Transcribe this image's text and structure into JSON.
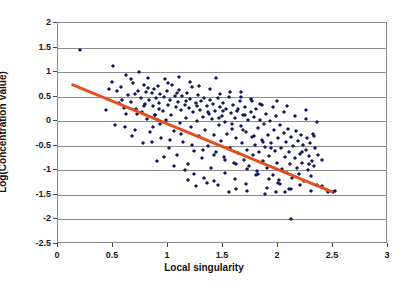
{
  "chart_data": {
    "type": "scatter",
    "title": "",
    "xlabel": "Local singularity",
    "ylabel": "Log(Concentration Value)",
    "xlim": [
      0,
      3
    ],
    "ylim": [
      -2.5,
      2
    ],
    "xticks": [
      "0",
      "0.5",
      "1",
      "1.5",
      "2",
      "2.5",
      "3"
    ],
    "xtick_values": [
      0,
      0.5,
      1,
      1.5,
      2,
      2.5,
      3
    ],
    "yticks": [
      "2",
      "1.5",
      "1",
      "0.5",
      "0",
      "-0.5",
      "-1",
      "-1.5",
      "-2",
      "-2.5"
    ],
    "ytick_values": [
      2,
      1.5,
      1,
      0.5,
      0,
      -0.5,
      -1,
      -1.5,
      -2,
      -2.5
    ],
    "grid": true,
    "grid_axis": "y",
    "legend": "none",
    "point_color": "#17175c",
    "point_marker": "diamond",
    "trendline": {
      "color": "#e1501f",
      "x_start": 0.12,
      "y_start": 0.75,
      "x_end": 2.5,
      "y_end": -1.45,
      "slope": -0.924,
      "intercept": 0.861
    },
    "points": [
      [
        0.2,
        1.45
      ],
      [
        0.46,
        0.66
      ],
      [
        0.5,
        1.12
      ],
      [
        0.54,
        0.62
      ],
      [
        0.57,
        0.7
      ],
      [
        0.6,
        0.27
      ],
      [
        0.62,
        0.95
      ],
      [
        0.64,
        0.53
      ],
      [
        0.66,
        0.4
      ],
      [
        0.68,
        0.77
      ],
      [
        0.7,
        0.55
      ],
      [
        0.71,
        0.24
      ],
      [
        0.73,
        0.62
      ],
      [
        0.74,
        1.0
      ],
      [
        0.75,
        0.47
      ],
      [
        0.76,
        0.18
      ],
      [
        0.78,
        0.74
      ],
      [
        0.79,
        0.35
      ],
      [
        0.8,
        0.6
      ],
      [
        0.81,
        0.05
      ],
      [
        0.82,
        0.88
      ],
      [
        0.83,
        0.44
      ],
      [
        0.84,
        -0.22
      ],
      [
        0.85,
        0.58
      ],
      [
        0.86,
        0.3
      ],
      [
        0.87,
        0.66
      ],
      [
        0.88,
        0.13
      ],
      [
        0.89,
        0.47
      ],
      [
        0.9,
        -0.82
      ],
      [
        0.91,
        0.71
      ],
      [
        0.92,
        0.38
      ],
      [
        0.93,
        0.55
      ],
      [
        0.94,
        -0.35
      ],
      [
        0.95,
        0.2
      ],
      [
        0.96,
        0.49
      ],
      [
        0.97,
        0.85
      ],
      [
        0.98,
        0.02
      ],
      [
        0.99,
        0.61
      ],
      [
        1.0,
        0.33
      ],
      [
        1.01,
        -0.55
      ],
      [
        1.02,
        0.44
      ],
      [
        1.03,
        0.12
      ],
      [
        1.04,
        0.74
      ],
      [
        1.05,
        -0.2
      ],
      [
        1.06,
        0.52
      ],
      [
        1.07,
        0.28
      ],
      [
        1.08,
        -0.68
      ],
      [
        1.09,
        0.4
      ],
      [
        1.1,
        0.63
      ],
      [
        1.11,
        -0.04
      ],
      [
        1.12,
        0.22
      ],
      [
        1.13,
        0.51
      ],
      [
        1.14,
        -0.42
      ],
      [
        1.15,
        0.34
      ],
      [
        1.16,
        0.07
      ],
      [
        1.17,
        0.58
      ],
      [
        1.18,
        -0.88
      ],
      [
        1.19,
        0.26
      ],
      [
        1.2,
        0.45
      ],
      [
        1.21,
        -0.12
      ],
      [
        1.22,
        0.69
      ],
      [
        1.23,
        0.18
      ],
      [
        1.24,
        -0.6
      ],
      [
        1.25,
        0.37
      ],
      [
        1.26,
        0.0
      ],
      [
        1.27,
        0.54
      ],
      [
        1.28,
        -0.3
      ],
      [
        1.29,
        0.23
      ],
      [
        1.3,
        0.41
      ],
      [
        1.31,
        -0.75
      ],
      [
        1.32,
        0.09
      ],
      [
        1.33,
        0.48
      ],
      [
        1.34,
        -0.18
      ],
      [
        1.35,
        0.31
      ],
      [
        1.36,
        -0.5
      ],
      [
        1.37,
        0.15
      ],
      [
        1.38,
        0.43
      ],
      [
        1.39,
        -0.95
      ],
      [
        1.4,
        0.04
      ],
      [
        1.41,
        0.36
      ],
      [
        1.42,
        -0.28
      ],
      [
        1.43,
        0.2
      ],
      [
        1.44,
        -0.62
      ],
      [
        1.45,
        0.47
      ],
      [
        1.46,
        -0.08
      ],
      [
        1.47,
        0.29
      ],
      [
        1.48,
        -0.4
      ],
      [
        1.49,
        0.11
      ],
      [
        1.5,
        0.38
      ],
      [
        1.51,
        -0.72
      ],
      [
        1.52,
        -0.02
      ],
      [
        1.53,
        0.25
      ],
      [
        1.54,
        -0.25
      ],
      [
        1.55,
        0.5
      ],
      [
        1.56,
        -0.55
      ],
      [
        1.57,
        0.16
      ],
      [
        1.58,
        -0.15
      ],
      [
        1.59,
        0.33
      ],
      [
        1.6,
        -0.85
      ],
      [
        1.61,
        0.06
      ],
      [
        1.62,
        -0.35
      ],
      [
        1.63,
        0.21
      ],
      [
        1.64,
        -0.65
      ],
      [
        1.65,
        0.41
      ],
      [
        1.66,
        -0.1
      ],
      [
        1.67,
        -0.45
      ],
      [
        1.68,
        0.13
      ],
      [
        1.69,
        -0.78
      ],
      [
        1.7,
        0.28
      ],
      [
        1.71,
        -0.22
      ],
      [
        1.72,
        -0.58
      ],
      [
        1.73,
        0.02
      ],
      [
        1.74,
        -0.92
      ],
      [
        1.75,
        0.19
      ],
      [
        1.76,
        -0.32
      ],
      [
        1.77,
        -0.68
      ],
      [
        1.78,
        0.08
      ],
      [
        1.79,
        -0.48
      ],
      [
        1.8,
        0.24
      ],
      [
        1.81,
        -1.02
      ],
      [
        1.82,
        -0.14
      ],
      [
        1.83,
        -0.62
      ],
      [
        1.84,
        0.35
      ],
      [
        1.85,
        -0.38
      ],
      [
        1.86,
        -0.8
      ],
      [
        1.87,
        -0.05
      ],
      [
        1.88,
        -0.52
      ],
      [
        1.89,
        0.15
      ],
      [
        1.9,
        -0.95
      ],
      [
        1.91,
        -0.28
      ],
      [
        1.92,
        -0.7
      ],
      [
        1.93,
        0.0
      ],
      [
        1.94,
        -0.44
      ],
      [
        1.95,
        -1.1
      ],
      [
        1.96,
        -0.18
      ],
      [
        1.97,
        -0.6
      ],
      [
        1.98,
        0.1
      ],
      [
        1.99,
        -0.86
      ],
      [
        2.0,
        -0.34
      ],
      [
        2.01,
        -1.2
      ],
      [
        2.02,
        -0.08
      ],
      [
        2.03,
        -0.55
      ],
      [
        2.04,
        -0.98
      ],
      [
        2.05,
        -0.24
      ],
      [
        2.06,
        -0.72
      ],
      [
        2.07,
        -0.42
      ],
      [
        2.08,
        -1.05
      ],
      [
        2.09,
        -0.15
      ],
      [
        2.1,
        -0.62
      ],
      [
        2.11,
        -0.88
      ],
      [
        2.12,
        -0.32
      ],
      [
        2.13,
        -1.15
      ],
      [
        2.14,
        -0.5
      ],
      [
        2.15,
        -0.75
      ],
      [
        2.16,
        -0.2
      ],
      [
        2.17,
        -0.95
      ],
      [
        2.18,
        -0.4
      ],
      [
        2.19,
        -1.08
      ],
      [
        2.2,
        -0.66
      ],
      [
        2.21,
        -0.28
      ],
      [
        2.22,
        -0.85
      ],
      [
        2.23,
        -0.48
      ],
      [
        2.24,
        -1.22
      ],
      [
        2.25,
        -0.58
      ],
      [
        2.26,
        -0.35
      ],
      [
        2.27,
        -1.0
      ],
      [
        2.28,
        -0.7
      ],
      [
        2.29,
        -0.45
      ],
      [
        2.3,
        -1.12
      ],
      [
        2.31,
        -0.8
      ],
      [
        2.32,
        -0.25
      ],
      [
        2.33,
        -0.92
      ],
      [
        2.34,
        -0.55
      ],
      [
        2.35,
        -1.3
      ],
      [
        2.36,
        -0.68
      ],
      [
        0.44,
        0.22
      ],
      [
        0.52,
        -0.08
      ],
      [
        0.58,
        0.44
      ],
      [
        0.67,
        -0.3
      ],
      [
        0.72,
        0.15
      ],
      [
        0.77,
        -0.45
      ],
      [
        0.82,
        0.68
      ],
      [
        0.86,
        -0.12
      ],
      [
        0.91,
        0.02
      ],
      [
        0.96,
        -0.72
      ],
      [
        1.0,
        0.78
      ],
      [
        1.05,
        -0.92
      ],
      [
        1.1,
        0.9
      ],
      [
        1.15,
        -1.0
      ],
      [
        1.2,
        0.8
      ],
      [
        1.24,
        -1.08
      ],
      [
        1.28,
        0.72
      ],
      [
        1.33,
        -1.15
      ],
      [
        1.38,
        0.66
      ],
      [
        1.42,
        -1.22
      ],
      [
        1.47,
        0.55
      ],
      [
        1.52,
        -1.05
      ],
      [
        1.56,
        0.6
      ],
      [
        1.61,
        -1.18
      ],
      [
        1.66,
        0.5
      ],
      [
        1.71,
        -1.28
      ],
      [
        1.76,
        0.42
      ],
      [
        1.8,
        -1.1
      ],
      [
        1.85,
        0.33
      ],
      [
        1.9,
        -1.35
      ],
      [
        1.95,
        0.28
      ],
      [
        2.0,
        -1.25
      ],
      [
        2.05,
        0.18
      ],
      [
        2.1,
        -1.38
      ],
      [
        2.15,
        0.1
      ],
      [
        2.2,
        -1.3
      ],
      [
        2.25,
        0.05
      ],
      [
        2.3,
        -1.42
      ],
      [
        2.35,
        -0.02
      ],
      [
        2.4,
        -1.32
      ],
      [
        2.45,
        -1.45
      ],
      [
        2.5,
        -1.45
      ],
      [
        2.52,
        -1.42
      ],
      [
        2.12,
        -2.0
      ],
      [
        1.98,
        -1.45
      ],
      [
        2.25,
        0.22
      ],
      [
        2.33,
        -0.3
      ],
      [
        2.4,
        -0.78
      ],
      [
        2.06,
        -1.44
      ],
      [
        1.88,
        -1.48
      ],
      [
        1.72,
        -1.42
      ],
      [
        1.62,
        -1.38
      ],
      [
        1.55,
        -1.45
      ],
      [
        1.45,
        -1.3
      ],
      [
        1.35,
        -1.26
      ],
      [
        1.25,
        -1.32
      ],
      [
        1.18,
        -1.2
      ],
      [
        0.88,
        0.12
      ],
      [
        0.93,
        -0.05
      ],
      [
        1.02,
        -0.38
      ],
      [
        1.12,
        -0.25
      ],
      [
        1.22,
        -0.48
      ],
      [
        1.32,
        -0.58
      ],
      [
        1.42,
        -0.68
      ],
      [
        1.52,
        -0.78
      ],
      [
        1.62,
        -0.88
      ],
      [
        1.72,
        -0.98
      ],
      [
        1.82,
        -1.08
      ],
      [
        1.92,
        -1.18
      ],
      [
        2.02,
        -1.28
      ],
      [
        2.12,
        -1.38
      ],
      [
        0.62,
        0.15
      ],
      [
        0.7,
        -0.18
      ],
      [
        0.78,
        0.3
      ],
      [
        0.85,
        -0.42
      ],
      [
        0.92,
        0.25
      ],
      [
        1.08,
        0.58
      ],
      [
        1.16,
        0.42
      ],
      [
        1.26,
        0.3
      ],
      [
        1.36,
        0.18
      ],
      [
        1.46,
        0.06
      ],
      [
        1.58,
        -0.06
      ],
      [
        1.68,
        -0.18
      ],
      [
        1.78,
        -0.3
      ],
      [
        1.86,
        -0.42
      ],
      [
        1.94,
        -0.54
      ],
      [
        0.49,
        0.8
      ],
      [
        0.55,
        0.38
      ],
      [
        0.61,
        -0.12
      ],
      [
        0.66,
        0.85
      ],
      [
        1.44,
        0.88
      ],
      [
        1.5,
        0.2
      ],
      [
        1.64,
        0.24
      ],
      [
        1.7,
        0.12
      ],
      [
        1.84,
        0.02
      ],
      [
        2.22,
        -0.62
      ],
      [
        2.28,
        -0.88
      ],
      [
        1.99,
        0.42
      ],
      [
        2.08,
        0.3
      ],
      [
        1.75,
        0.46
      ],
      [
        1.66,
        0.6
      ]
    ]
  }
}
